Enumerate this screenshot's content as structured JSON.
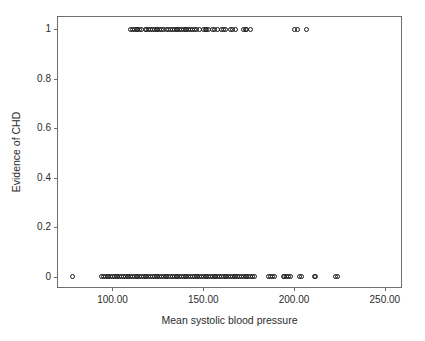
{
  "chart_data": {
    "type": "scatter",
    "title": "",
    "xlabel": "Mean systolic blood pressure",
    "ylabel": "Evidence of CHD",
    "xlim": [
      70,
      260
    ],
    "ylim": [
      -0.05,
      1.05
    ],
    "grid": false,
    "legend": "none",
    "marker": "open-circle",
    "marker_color": "#1a1a1a",
    "xticks": [
      100,
      150,
      200,
      250
    ],
    "xticklabels": [
      "100.00",
      "150.00",
      "200.00",
      "250.00"
    ],
    "yticks": [
      0,
      0.2,
      0.4,
      0.6,
      0.8,
      1
    ],
    "yticklabels": [
      "0",
      "0.2",
      "0.4",
      "0.6",
      "0.8",
      "1"
    ],
    "series": [
      {
        "name": "CHD = 1",
        "y": 1,
        "x": [
          110,
          111,
          112,
          113,
          114,
          115,
          116,
          118,
          119,
          120,
          121,
          122,
          123,
          124,
          125,
          126,
          127,
          128,
          130,
          131,
          132,
          133,
          134,
          135,
          136,
          137,
          138,
          139,
          140,
          141,
          142,
          143,
          144,
          145,
          146,
          148,
          150,
          151,
          152,
          153,
          155,
          156,
          158,
          160,
          161,
          162,
          165,
          166,
          168,
          172,
          173,
          174,
          176,
          200,
          202,
          207
        ]
      },
      {
        "name": "CHD = 0",
        "y": 0,
        "x": [
          78,
          94,
          95,
          96,
          97,
          98,
          99,
          100,
          101,
          102,
          103,
          104,
          105,
          106,
          107,
          108,
          109,
          110,
          111,
          112,
          113,
          114,
          115,
          116,
          117,
          118,
          119,
          120,
          121,
          122,
          123,
          124,
          125,
          126,
          127,
          128,
          129,
          130,
          131,
          132,
          133,
          134,
          135,
          136,
          137,
          138,
          139,
          140,
          141,
          142,
          143,
          144,
          145,
          146,
          147,
          148,
          149,
          150,
          151,
          152,
          153,
          154,
          155,
          156,
          157,
          158,
          159,
          160,
          161,
          162,
          163,
          164,
          165,
          166,
          167,
          168,
          169,
          170,
          171,
          172,
          173,
          174,
          175,
          176,
          177,
          178,
          186,
          187,
          188,
          189,
          194,
          195,
          196,
          197,
          198,
          203,
          204,
          211,
          212,
          223,
          224
        ]
      }
    ],
    "counts": {
      "chd_1": 56,
      "chd_0": 101
    }
  },
  "axes": {
    "y_title": "Evidence of CHD",
    "x_title": "Mean systolic blood pressure",
    "y_tick_labels": [
      "1",
      "0.8",
      "0.6",
      "0.4",
      "0.2",
      "0"
    ],
    "x_tick_labels": [
      "100.00",
      "150.00",
      "200.00",
      "250.00"
    ]
  },
  "colors": {
    "frame": "#6e6e6e",
    "text": "#2b2b2b",
    "marker": "#1a1a1a",
    "background": "#ffffff"
  }
}
